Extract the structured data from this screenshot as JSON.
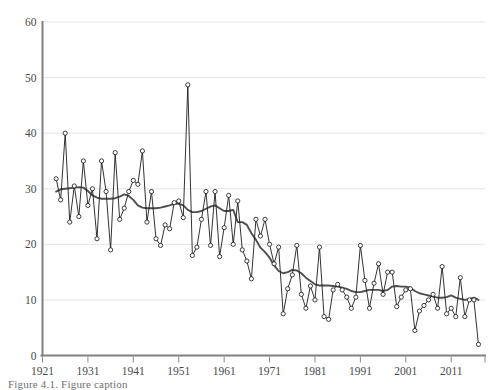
{
  "chart_data": {
    "type": "line",
    "title": "",
    "subtitle": "",
    "xlabel": "",
    "ylabel": "",
    "xlim": [
      1921,
      2018
    ],
    "ylim": [
      0,
      60
    ],
    "grid": true,
    "legend_position": "none",
    "x_tick_labels": [
      "1921",
      "1931",
      "1941",
      "1951",
      "1961",
      "1971",
      "1981",
      "1991",
      "2001",
      "2011"
    ],
    "x_ticks": [
      1921,
      1931,
      1941,
      1951,
      1961,
      1971,
      1981,
      1991,
      2001,
      2011
    ],
    "y_tick_labels": [
      "0",
      "10",
      "20",
      "30",
      "40",
      "50",
      "60"
    ],
    "y_ticks": [
      0,
      10,
      20,
      30,
      40,
      50,
      60
    ],
    "marker": "open-circle",
    "x": [
      1924,
      1925,
      1926,
      1927,
      1928,
      1929,
      1930,
      1931,
      1932,
      1933,
      1934,
      1935,
      1936,
      1937,
      1938,
      1939,
      1940,
      1941,
      1942,
      1943,
      1944,
      1945,
      1946,
      1947,
      1948,
      1949,
      1950,
      1951,
      1952,
      1953,
      1954,
      1955,
      1956,
      1957,
      1958,
      1959,
      1960,
      1961,
      1962,
      1963,
      1964,
      1965,
      1966,
      1967,
      1968,
      1969,
      1970,
      1971,
      1972,
      1973,
      1974,
      1975,
      1976,
      1977,
      1978,
      1979,
      1980,
      1981,
      1982,
      1983,
      1984,
      1985,
      1986,
      1987,
      1988,
      1989,
      1990,
      1991,
      1992,
      1993,
      1994,
      1995,
      1996,
      1997,
      1998,
      1999,
      2000,
      2001,
      2002,
      2003,
      2004,
      2005,
      2006,
      2007,
      2008,
      2009,
      2010,
      2011,
      2012,
      2013,
      2014,
      2015,
      2016,
      2017
    ],
    "series": [
      {
        "name": "annual-value",
        "style": "line-markers",
        "values": [
          31.8,
          28.0,
          40.0,
          24.0,
          30.5,
          25.0,
          35.0,
          27.0,
          30.0,
          21.0,
          35.0,
          29.5,
          19.0,
          36.5,
          24.5,
          26.5,
          29.5,
          31.5,
          30.8,
          36.8,
          24.0,
          29.5,
          21.0,
          19.8,
          23.5,
          22.8,
          27.5,
          27.8,
          24.8,
          48.7,
          18.0,
          19.5,
          24.5,
          29.5,
          19.8,
          29.5,
          17.8,
          23.0,
          28.8,
          20.0,
          27.8,
          19.0,
          17.0,
          13.8,
          24.5,
          21.5,
          24.5,
          20.0,
          16.5,
          19.5,
          7.5,
          12.0,
          14.5,
          19.8,
          11.0,
          8.5,
          12.5,
          10.0,
          19.5,
          7.0,
          6.5,
          11.8,
          12.8,
          11.8,
          10.5,
          8.5,
          10.5,
          19.8,
          13.5,
          8.5,
          13.0,
          16.5,
          11.0,
          15.0,
          15.0,
          8.8,
          10.5,
          11.8,
          12.0,
          4.5,
          8.0,
          9.0,
          10.0,
          11.0,
          8.5,
          16.0,
          7.5,
          8.5,
          7.0,
          14.0,
          7.0,
          10.0,
          10.0,
          2.0
        ]
      },
      {
        "name": "smoothed-trend",
        "style": "line",
        "values": [
          29.5,
          29.9,
          30.0,
          30.1,
          30.2,
          30.3,
          30.2,
          29.6,
          28.8,
          28.4,
          28.2,
          28.2,
          28.2,
          28.3,
          28.6,
          29.0,
          28.7,
          28.0,
          27.0,
          26.6,
          26.5,
          26.5,
          26.5,
          26.6,
          26.8,
          27.0,
          27.3,
          27.3,
          27.0,
          26.2,
          25.8,
          25.8,
          26.0,
          26.4,
          26.8,
          27.0,
          26.5,
          26.0,
          26.0,
          26.2,
          24.0,
          24.0,
          23.5,
          22.0,
          20.8,
          19.4,
          18.6,
          17.6,
          16.2,
          15.2,
          14.8,
          15.0,
          15.4,
          15.3,
          14.8,
          14.0,
          13.4,
          12.8,
          12.6,
          12.6,
          12.6,
          12.5,
          12.4,
          12.2,
          12.0,
          11.6,
          11.4,
          11.4,
          11.6,
          11.8,
          11.8,
          11.8,
          11.6,
          11.8,
          12.4,
          12.5,
          12.4,
          12.4,
          12.2,
          11.6,
          11.2,
          11.0,
          10.8,
          10.6,
          10.4,
          10.4,
          10.5,
          10.8,
          10.4,
          10.2,
          10.0,
          10.2,
          10.4,
          10.0
        ]
      }
    ]
  },
  "caption": {
    "text": "Figure 4.1.  Figure caption"
  }
}
